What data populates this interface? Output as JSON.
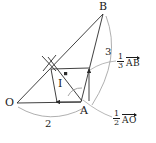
{
  "figure": {
    "type": "geometry-vector-diagram",
    "points": [
      {
        "name": "O",
        "label": "O",
        "x": 14,
        "y": 104
      },
      {
        "name": "A",
        "label": "A",
        "x": 82,
        "y": 104
      },
      {
        "name": "B",
        "label": "B",
        "x": 104,
        "y": 10
      },
      {
        "name": "I",
        "label": "I",
        "x": 62,
        "y": 76
      }
    ],
    "annotations": {
      "arc_oa_label": "2",
      "arc_ab_label": "3",
      "vector_ab_coeff_num": "1",
      "vector_ab_coeff_den": "3",
      "vector_ab_name": "AB",
      "vector_ao_coeff_num": "1",
      "vector_ao_coeff_den": "2",
      "vector_ao_name": "AO"
    },
    "colors": {
      "stroke": "#2b2b2b",
      "arc": "#9a9a9a",
      "text": "#1a1a1a",
      "background": "#ffffff"
    }
  }
}
